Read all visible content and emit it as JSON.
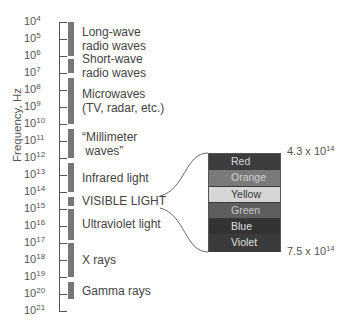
{
  "chart_data": {
    "type": "diagram",
    "title": "",
    "ylabel": "Frequency, Hz",
    "axis": {
      "min_exponent": 4,
      "max_exponent": 21,
      "base": 10
    },
    "tick_labels": [
      "10^4",
      "10^5",
      "10^6",
      "10^7",
      "10^8",
      "10^9",
      "10^10",
      "10^11",
      "10^12",
      "10^13",
      "10^14",
      "10^15",
      "10^16",
      "10^17",
      "10^18",
      "10^19",
      "10^20",
      "10^21"
    ],
    "bands": [
      {
        "name": "Long-wave radio waves",
        "from_exp": 4.0,
        "to_exp": 6.0
      },
      {
        "name": "Short-wave radio waves",
        "from_exp": 6.2,
        "to_exp": 7.0
      },
      {
        "name": "Microwaves (TV, radar, etc.)",
        "from_exp": 7.3,
        "to_exp": 10.0
      },
      {
        "name": "“Millimeter waves”",
        "from_exp": 10.3,
        "to_exp": 12.0
      },
      {
        "name": "Infrared light",
        "from_exp": 12.3,
        "to_exp": 14.0
      },
      {
        "name": "VISIBLE LIGHT",
        "from_exp": 14.3,
        "to_exp": 14.8
      },
      {
        "name": "Ultraviolet light",
        "from_exp": 15.0,
        "to_exp": 16.8
      },
      {
        "name": "X rays",
        "from_exp": 17.0,
        "to_exp": 19.0
      },
      {
        "name": "Gamma rays",
        "from_exp": 19.3,
        "to_exp": 20.3
      }
    ],
    "visible_spectrum": {
      "colors": [
        "Red",
        "Orange",
        "Yellow",
        "Green",
        "Blue",
        "Violet"
      ],
      "low_frequency": "4.3 x 10^14",
      "high_frequency": "7.5 x 10^14"
    }
  },
  "ylabel": "Frequency, Hz",
  "ticks": [
    {
      "base": "10",
      "exp": "4"
    },
    {
      "base": "10",
      "exp": "5"
    },
    {
      "base": "10",
      "exp": "6"
    },
    {
      "base": "10",
      "exp": "7"
    },
    {
      "base": "10",
      "exp": "8"
    },
    {
      "base": "10",
      "exp": "9"
    },
    {
      "base": "10",
      "exp": "10"
    },
    {
      "base": "10",
      "exp": "11"
    },
    {
      "base": "10",
      "exp": "12"
    },
    {
      "base": "10",
      "exp": "13"
    },
    {
      "base": "10",
      "exp": "14"
    },
    {
      "base": "10",
      "exp": "15"
    },
    {
      "base": "10",
      "exp": "16"
    },
    {
      "base": "10",
      "exp": "17"
    },
    {
      "base": "10",
      "exp": "18"
    },
    {
      "base": "10",
      "exp": "19"
    },
    {
      "base": "10",
      "exp": "20"
    },
    {
      "base": "10",
      "exp": "21"
    }
  ],
  "bands": [
    {
      "line1": "Long-wave",
      "line2": "radio waves"
    },
    {
      "line1": "Short-wave",
      "line2": "radio waves"
    },
    {
      "line1": "Microwaves",
      "line2": "(TV, radar, etc.)"
    },
    {
      "line1": "“Millimeter",
      "line2": " waves”"
    },
    {
      "line1": "Infrared light"
    },
    {
      "line1": "VISIBLE LIGHT"
    },
    {
      "line1": "Ultraviolet light"
    },
    {
      "line1": "X rays"
    },
    {
      "line1": "Gamma rays"
    }
  ],
  "spectrum": {
    "rows": [
      {
        "label": "Red",
        "bg": "#3d3d3d",
        "fg": "#d8d8d8"
      },
      {
        "label": "Orange",
        "bg": "#7a7a7a",
        "fg": "#d0d0d0"
      },
      {
        "label": "Yellow",
        "bg": "#d6d6d6",
        "fg": "#333333"
      },
      {
        "label": "Green",
        "bg": "#5e5e5e",
        "fg": "#c8c8c8"
      },
      {
        "label": "Blue",
        "bg": "#333333",
        "fg": "#e0e0e0"
      },
      {
        "label": "Violet",
        "bg": "#3a3a3a",
        "fg": "#e0e0e0"
      }
    ],
    "top_freq": {
      "mantissa": "4.3 x 10",
      "exp": "14"
    },
    "bottom_freq": {
      "mantissa": "7.5 x 10",
      "exp": "14"
    }
  }
}
